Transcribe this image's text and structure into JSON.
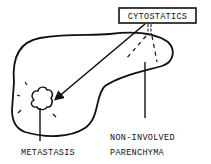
{
  "diagram": {
    "drug_label": "CYTOSTATICS",
    "labels": {
      "metastasis": "METASTASIS",
      "non_involved_line1": "NON-INVOLVED",
      "non_involved_line2": "PARENCHYMA"
    },
    "colors": {
      "ink": "#111111",
      "background": "#ffffff"
    }
  }
}
